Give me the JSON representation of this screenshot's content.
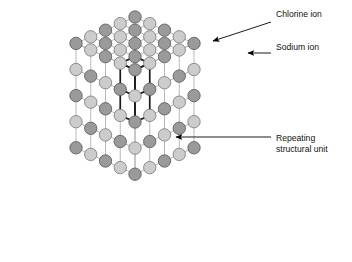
{
  "figure": {
    "name": "sodium-chloride-crystal-lattice",
    "background_color": "#ffffff"
  },
  "colors": {
    "chlorine_ion_fill": "#9a9a9a",
    "chlorine_ion_stroke": "#555555",
    "sodium_ion_fill": "#cccccc",
    "sodium_ion_stroke": "#777777",
    "bond_light": "#b0b0b0",
    "bond_dark": "#1a1a1a",
    "callout_line": "#000000",
    "text": "#111111"
  },
  "labels": {
    "chlorine": {
      "text": "Chlorine ion",
      "x": 276,
      "y": 17
    },
    "sodium": {
      "text": "Sodium ion",
      "x": 276,
      "y": 50
    },
    "repeating_unit": {
      "line1": "Repeating",
      "line2": "structural unit",
      "x": 276,
      "y": 141
    }
  },
  "callouts": [
    {
      "name": "chlorine-ion-callout",
      "label": "Chlorine ion",
      "path": "M 271 22 L 213 41",
      "arrow_x": 209,
      "arrow_y": 42.5,
      "arrow_angle": 342
    },
    {
      "name": "sodium-ion-callout",
      "label": "Sodium ion",
      "path": "M 271 53 L 248 53",
      "arrow_x": 243,
      "arrow_y": 53,
      "arrow_angle": 180
    },
    {
      "name": "repeating-unit-callout",
      "label": "Repeating structural unit",
      "path": "M 271 137 L 176 137",
      "arrow_x": 171,
      "arrow_y": 137,
      "arrow_angle": 180
    }
  ],
  "lattice": {
    "description": "Face-centred cubic rock-salt lattice drawn in isometric projection, 5 x 5 x 5 ion grid shown as three visible faces (top, left-front, right-front).",
    "ion_radius": 6.2,
    "ion_types": [
      "chlorine",
      "sodium"
    ],
    "geometry": {
      "origin_x": 135,
      "origin_y": 17,
      "step_x": 29.5,
      "step_y": 13.2,
      "vertical_step": 52.2,
      "rows": 5,
      "cols": 5,
      "levels": 5
    },
    "notes": "Ion type alternates with parity of (i + j + level) giving the rock-salt alternating arrangement; chlorine ions are the darker spheres."
  },
  "chart_data": {
    "type": "diagram",
    "legend": [
      "Chlorine ion",
      "Sodium ion",
      "Repeating structural unit"
    ],
    "annotations": [
      "Chlorine ion",
      "Sodium ion",
      "Repeating structural unit"
    ]
  }
}
